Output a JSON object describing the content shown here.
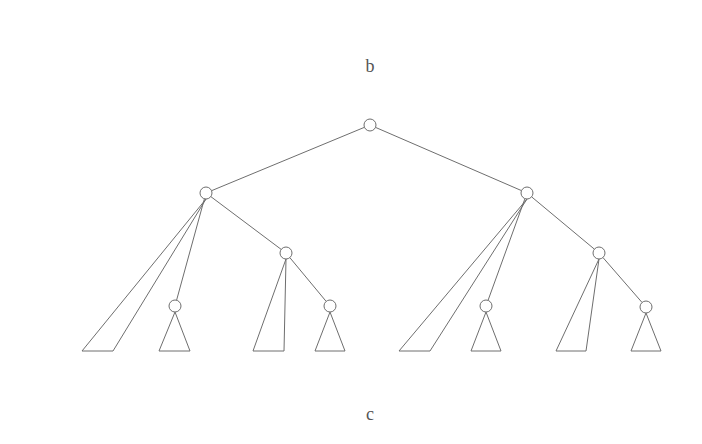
{
  "labels": {
    "top": "b",
    "bottom": "c"
  },
  "colors": {
    "stroke": "#6e6e6e",
    "text": "#555555",
    "background": "#ffffff"
  },
  "tree": {
    "node_radius": 6,
    "nodes": [
      {
        "id": "root",
        "x": 370,
        "y": 125
      },
      {
        "id": "L",
        "x": 206,
        "y": 193
      },
      {
        "id": "R",
        "x": 527,
        "y": 193
      },
      {
        "id": "L-mid",
        "x": 175,
        "y": 306
      },
      {
        "id": "LR",
        "x": 286,
        "y": 253
      },
      {
        "id": "LR-right",
        "x": 330,
        "y": 306
      },
      {
        "id": "R-mid",
        "x": 486,
        "y": 306
      },
      {
        "id": "RR",
        "x": 599,
        "y": 253
      },
      {
        "id": "RR-right",
        "x": 646,
        "y": 307
      }
    ],
    "edges": [
      [
        "root",
        "L"
      ],
      [
        "root",
        "R"
      ],
      [
        "L",
        "L-mid"
      ],
      [
        "L",
        "LR"
      ],
      [
        "LR",
        "LR-right"
      ],
      [
        "R",
        "R-mid"
      ],
      [
        "R",
        "RR"
      ],
      [
        "RR",
        "RR-right"
      ]
    ],
    "subtrees": [
      {
        "apex": "L",
        "points": [
          [
            206,
            199
          ],
          [
            82,
            351
          ],
          [
            113,
            351
          ]
        ]
      },
      {
        "apex": "L-mid",
        "points": [
          [
            175,
            312
          ],
          [
            159,
            351
          ],
          [
            190,
            351
          ]
        ]
      },
      {
        "apex": "LR",
        "points": [
          [
            286,
            259
          ],
          [
            253,
            351
          ],
          [
            284,
            351
          ]
        ]
      },
      {
        "apex": "LR-right",
        "points": [
          [
            330,
            312
          ],
          [
            315,
            351
          ],
          [
            345,
            351
          ]
        ]
      },
      {
        "apex": "R",
        "points": [
          [
            527,
            199
          ],
          [
            399,
            351
          ],
          [
            430,
            351
          ]
        ]
      },
      {
        "apex": "R-mid",
        "points": [
          [
            486,
            312
          ],
          [
            471,
            351
          ],
          [
            501,
            351
          ]
        ]
      },
      {
        "apex": "RR",
        "points": [
          [
            599,
            259
          ],
          [
            556,
            351
          ],
          [
            586,
            351
          ]
        ]
      },
      {
        "apex": "RR-right",
        "points": [
          [
            646,
            313
          ],
          [
            631,
            351
          ],
          [
            661,
            351
          ]
        ]
      }
    ]
  }
}
